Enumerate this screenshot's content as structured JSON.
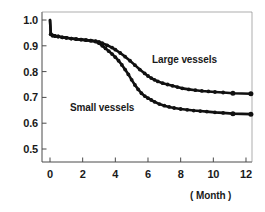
{
  "chart_data": {
    "type": "line",
    "title": "",
    "subtitle": "",
    "xlabel": "( Month )",
    "ylabel": "",
    "xlim": [
      -0.5,
      12.4
    ],
    "ylim": [
      0.46,
      1.03
    ],
    "xticks": [
      "0",
      "2",
      "4",
      "6",
      "8",
      "10",
      "12"
    ],
    "xtick_values": [
      0,
      2,
      4,
      6,
      8,
      10,
      12
    ],
    "yticks": [
      "1.0",
      "0.9",
      "0.8",
      "0.7",
      "0.6",
      "0.5"
    ],
    "ytick_values": [
      1.0,
      0.9,
      0.8,
      0.7,
      0.6,
      0.5
    ],
    "grid": false,
    "legend_position": "inline-annotation",
    "line_color": "#111111",
    "marker": "filled-circle",
    "annotations": [
      {
        "text": "Large vessels",
        "x": 7.6,
        "y": 0.845
      },
      {
        "text": "Small vessels",
        "x": 2.3,
        "y": 0.655
      }
    ],
    "series": [
      {
        "name": "Large vessels",
        "x": [
          0.0,
          0.05,
          0.15,
          0.3,
          0.5,
          0.75,
          1.0,
          1.3,
          1.6,
          1.9,
          2.2,
          2.5,
          2.8,
          3.0,
          3.2,
          3.5,
          3.8,
          4.0,
          4.3,
          4.6,
          4.9,
          5.2,
          5.5,
          5.8,
          6.0,
          6.2,
          6.4,
          6.6,
          6.9,
          7.2,
          7.5,
          7.8,
          8.1,
          8.5,
          8.9,
          9.3,
          9.7,
          10.1,
          10.6,
          11.2,
          12.3
        ],
        "y": [
          1.0,
          0.945,
          0.94,
          0.938,
          0.936,
          0.933,
          0.931,
          0.928,
          0.926,
          0.924,
          0.922,
          0.92,
          0.918,
          0.915,
          0.91,
          0.902,
          0.893,
          0.885,
          0.872,
          0.858,
          0.842,
          0.825,
          0.808,
          0.793,
          0.783,
          0.775,
          0.768,
          0.762,
          0.755,
          0.75,
          0.745,
          0.74,
          0.735,
          0.731,
          0.728,
          0.725,
          0.723,
          0.721,
          0.719,
          0.716,
          0.714
        ]
      },
      {
        "name": "Small vessels",
        "x": [
          0.0,
          0.05,
          0.15,
          0.3,
          0.5,
          0.75,
          1.0,
          1.3,
          1.6,
          1.9,
          2.2,
          2.5,
          2.8,
          3.0,
          3.2,
          3.4,
          3.6,
          3.8,
          4.0,
          4.2,
          4.4,
          4.6,
          4.8,
          5.0,
          5.2,
          5.4,
          5.6,
          5.8,
          6.0,
          6.2,
          6.4,
          6.7,
          7.0,
          7.3,
          7.6,
          8.0,
          8.4,
          8.8,
          9.2,
          9.6,
          10.1,
          10.6,
          11.2,
          12.3
        ],
        "y": [
          1.0,
          0.945,
          0.94,
          0.938,
          0.936,
          0.933,
          0.931,
          0.928,
          0.926,
          0.924,
          0.922,
          0.92,
          0.916,
          0.91,
          0.9,
          0.89,
          0.879,
          0.868,
          0.856,
          0.842,
          0.826,
          0.808,
          0.789,
          0.768,
          0.748,
          0.731,
          0.716,
          0.705,
          0.697,
          0.69,
          0.683,
          0.674,
          0.668,
          0.663,
          0.659,
          0.655,
          0.652,
          0.649,
          0.647,
          0.645,
          0.642,
          0.64,
          0.637,
          0.635
        ]
      }
    ]
  },
  "axes": {
    "y_labels": [
      "1.0",
      "0.9",
      "0.8",
      "0.7",
      "0.6",
      "0.5"
    ],
    "x_labels": [
      "0",
      "2",
      "4",
      "6",
      "8",
      "10",
      "12"
    ],
    "x_axis_title": "( Month )"
  },
  "labels": {
    "large_vessels": "Large vessels",
    "small_vessels": "Small vessels"
  }
}
